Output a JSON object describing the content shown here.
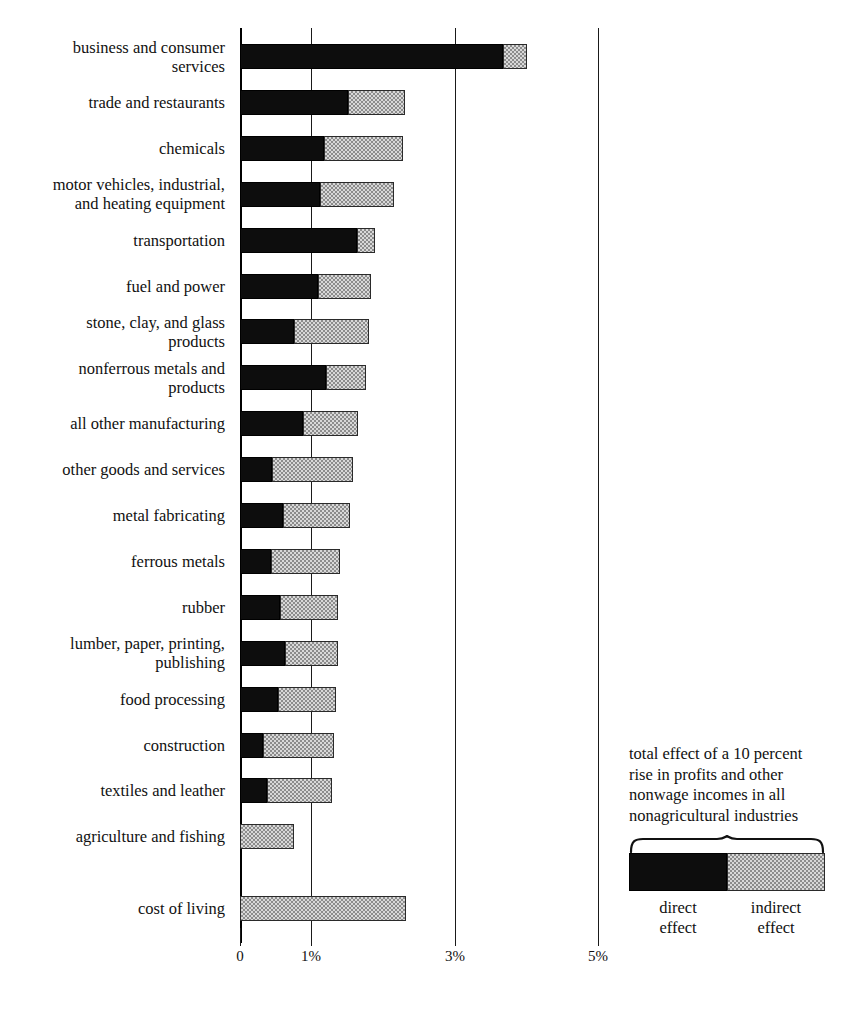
{
  "chart_data": {
    "type": "bar",
    "orientation": "horizontal",
    "stacked": true,
    "title": "",
    "xlabel": "",
    "ylabel": "",
    "xlim": [
      0,
      5.1
    ],
    "grid": true,
    "gridlines": [
      0,
      1,
      3,
      5
    ],
    "tick_labels": [
      "0",
      "1%",
      "3%",
      "5%"
    ],
    "series": [
      {
        "name": "direct effect",
        "color": "#0d0d0d"
      },
      {
        "name": "indirect effect",
        "color": "#d8d8d8"
      }
    ],
    "categories": [
      "business and consumer\nservices",
      "trade and restaurants",
      "chemicals",
      "motor vehicles, industrial,\nand heating equipment",
      "transportation",
      "fuel and power",
      "stone, clay, and glass\nproducts",
      "nonferrous metals and\nproducts",
      "all other manufacturing",
      "other goods and services",
      "metal fabricating",
      "ferrous metals",
      "rubber",
      "lumber, paper, printing,\npublishing",
      "food processing",
      "construction",
      "textiles and leather",
      "agriculture and fishing",
      "cost of living"
    ],
    "direct": [
      3.68,
      1.51,
      1.17,
      1.12,
      1.64,
      1.09,
      0.76,
      1.2,
      0.88,
      0.45,
      0.6,
      0.43,
      0.56,
      0.63,
      0.53,
      0.32,
      0.38,
      0.0,
      0.0
    ],
    "indirect": [
      0.33,
      0.8,
      1.11,
      1.04,
      0.25,
      0.74,
      1.04,
      0.56,
      0.77,
      1.13,
      0.94,
      0.97,
      0.81,
      0.74,
      0.81,
      0.99,
      0.91,
      0.76,
      2.32
    ],
    "totals": [
      4.01,
      2.31,
      2.28,
      2.16,
      1.89,
      1.83,
      1.8,
      1.76,
      1.65,
      1.58,
      1.54,
      1.4,
      1.37,
      1.37,
      1.34,
      1.31,
      1.29,
      0.76,
      2.32
    ]
  },
  "legend": {
    "caption": "total effect of a 10 percent\nrise in profits and other\nnonwage incomes in all\nnonagricultural industries",
    "keys": [
      {
        "label": "direct\neffect",
        "swatch": "solid-black-swatch"
      },
      {
        "label": "indirect\neffect",
        "swatch": "stippled-gray-swatch"
      }
    ]
  }
}
